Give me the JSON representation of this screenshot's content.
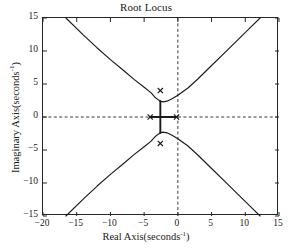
{
  "chart_data": {
    "type": "line",
    "title": "Root Locus",
    "xlabel_text": "Real Axis(seconds",
    "xlabel_sup": "-1",
    "xlabel_tail": ")",
    "ylabel_text": "Imaginary Axis(seconds",
    "ylabel_sup": "-1",
    "ylabel_tail": ")",
    "xlim": [
      -20,
      15
    ],
    "ylim": [
      -15,
      15
    ],
    "xticks": [
      -20,
      -15,
      -10,
      -5,
      0,
      5,
      10,
      15
    ],
    "xtick_labels": [
      "−20",
      "−15",
      "−10",
      "−5",
      "0",
      "5",
      "10",
      "15"
    ],
    "yticks": [
      -15,
      -10,
      -5,
      0,
      5,
      10,
      15
    ],
    "ytick_labels": [
      "−15",
      "−10",
      "−5",
      "0",
      "5",
      "10",
      "15"
    ],
    "grid": false,
    "legend": null,
    "zero_lines": {
      "horizontal_y": 0,
      "vertical_x": 0,
      "style": "dashed"
    },
    "poles": [
      {
        "real": -2.6,
        "imag": 4.0,
        "marker": "x"
      },
      {
        "real": -2.6,
        "imag": -4.0,
        "marker": "x"
      },
      {
        "real": -4.1,
        "imag": 0.0,
        "marker": "x"
      },
      {
        "real": -0.2,
        "imag": 0.0,
        "marker": "x"
      }
    ],
    "branches": [
      {
        "name": "real-axis-segment",
        "points": [
          [
            -4.1,
            0.0
          ],
          [
            -0.2,
            0.0
          ]
        ]
      },
      {
        "name": "vertical-breakaway-upper",
        "points": [
          [
            -2.6,
            0.0
          ],
          [
            -2.6,
            2.4
          ]
        ]
      },
      {
        "name": "vertical-breakaway-lower",
        "points": [
          [
            -2.6,
            0.0
          ],
          [
            -2.6,
            -2.4
          ]
        ]
      },
      {
        "name": "upper-left-asymptotic-branch",
        "points": [
          [
            -16.6,
            15.0
          ],
          [
            -14.0,
            12.4
          ],
          [
            -12.0,
            10.5
          ],
          [
            -10.0,
            8.7
          ],
          [
            -8.0,
            7.0
          ],
          [
            -6.5,
            5.7
          ],
          [
            -5.0,
            4.5
          ],
          [
            -4.0,
            3.7
          ],
          [
            -3.4,
            3.0
          ],
          [
            -2.9,
            2.6
          ],
          [
            -2.6,
            2.4
          ]
        ]
      },
      {
        "name": "upper-right-asymptotic-branch",
        "points": [
          [
            -2.6,
            2.4
          ],
          [
            -2.2,
            2.3
          ],
          [
            -1.6,
            2.4
          ],
          [
            -0.8,
            2.8
          ],
          [
            0.0,
            3.3
          ],
          [
            1.5,
            4.4
          ],
          [
            3.0,
            5.8
          ],
          [
            5.0,
            7.8
          ],
          [
            7.0,
            9.8
          ],
          [
            9.0,
            11.8
          ],
          [
            11.0,
            13.8
          ],
          [
            12.2,
            15.0
          ]
        ]
      },
      {
        "name": "lower-left-asymptotic-branch",
        "points": [
          [
            -16.6,
            -15.0
          ],
          [
            -14.0,
            -12.4
          ],
          [
            -12.0,
            -10.5
          ],
          [
            -10.0,
            -8.7
          ],
          [
            -8.0,
            -7.0
          ],
          [
            -6.5,
            -5.7
          ],
          [
            -5.0,
            -4.5
          ],
          [
            -4.0,
            -3.7
          ],
          [
            -3.4,
            -3.0
          ],
          [
            -2.9,
            -2.6
          ],
          [
            -2.6,
            -2.4
          ]
        ]
      },
      {
        "name": "lower-right-asymptotic-branch",
        "points": [
          [
            -2.6,
            -2.4
          ],
          [
            -2.2,
            -2.3
          ],
          [
            -1.6,
            -2.4
          ],
          [
            -0.8,
            -2.8
          ],
          [
            0.0,
            -3.3
          ],
          [
            1.5,
            -4.4
          ],
          [
            3.0,
            -5.8
          ],
          [
            5.0,
            -7.8
          ],
          [
            7.0,
            -9.8
          ],
          [
            9.0,
            -11.8
          ],
          [
            11.0,
            -13.8
          ],
          [
            12.2,
            -15.0
          ]
        ]
      }
    ],
    "colors": {
      "locus": "#1a1a1a",
      "axis": "#262626",
      "zero_line": "#3a3a3a",
      "background": "#ffffff"
    }
  }
}
